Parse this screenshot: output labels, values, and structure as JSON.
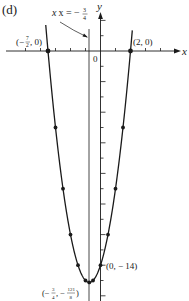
{
  "panel_label": "(d)",
  "axes": {
    "x_label": "x",
    "y_label": "y",
    "origin_label": "0"
  },
  "annotations": {
    "axis_of_symmetry": "x = −",
    "axis_of_symmetry_frac_num": "3",
    "axis_of_symmetry_frac_den": "4",
    "left_root": "(−",
    "left_root_num": "7",
    "left_root_den": "2",
    "left_root_tail": ", 0)",
    "right_root": "(2, 0)",
    "y_intercept": "(0, − 14)",
    "vertex_pre": "(−",
    "vertex_x_num": "3",
    "vertex_x_den": "4",
    "vertex_mid": ", −",
    "vertex_y_num": "121",
    "vertex_y_den": "8",
    "vertex_tail": ")"
  },
  "colors": {
    "curve": "#1a1a1a",
    "axes": "#1a1a1a",
    "background": "#ffffff"
  },
  "chart_data": {
    "type": "line",
    "title": "(d)",
    "function": "y = 2x^2 + 3x - 14",
    "xlabel": "x",
    "ylabel": "y",
    "xlim": [
      -6.5,
      5.5
    ],
    "ylim": [
      -16,
      3
    ],
    "grid": false,
    "legend": null,
    "x_ticks_units": [
      -5,
      -4,
      -3,
      -2,
      -1,
      1,
      2,
      3,
      4
    ],
    "y_ticks_units": [
      2,
      1,
      -1,
      -2,
      -3,
      -4,
      -5,
      -6,
      -7,
      -8,
      -9,
      -10,
      -11,
      -12,
      -13,
      -14,
      -15,
      -16
    ],
    "axis_of_symmetry": -0.75,
    "points": [
      {
        "x": -3.5,
        "y": 0,
        "label": "(-7/2, 0)"
      },
      {
        "x": 2,
        "y": 0,
        "label": "(2, 0)"
      },
      {
        "x": -3,
        "y": -5
      },
      {
        "x": 1.5,
        "y": -5
      },
      {
        "x": -2.5,
        "y": -9
      },
      {
        "x": 1,
        "y": -9
      },
      {
        "x": -2,
        "y": -12
      },
      {
        "x": 0.5,
        "y": -12
      },
      {
        "x": -1.5,
        "y": -14
      },
      {
        "x": 0,
        "y": -14,
        "label": "(0, -14)"
      },
      {
        "x": -1,
        "y": -15
      },
      {
        "x": -0.5,
        "y": -15
      },
      {
        "x": -0.75,
        "y": -15.125,
        "label": "(-3/4, -121/8)"
      }
    ]
  }
}
